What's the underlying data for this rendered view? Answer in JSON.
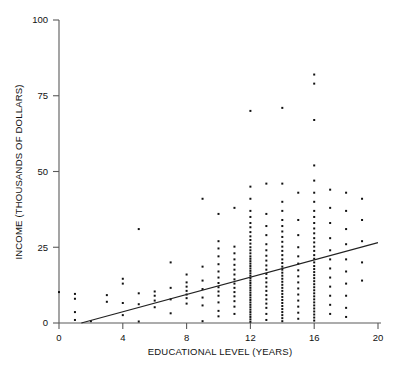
{
  "figure": {
    "title": "",
    "axis_color": "#5a5a5a",
    "point_color": "#111111",
    "line_color": "#222222",
    "background": "#ffffff"
  },
  "chart_data": {
    "type": "scatter",
    "title": "",
    "subtitle": "",
    "xlabel": "EDUCATIONAL LEVEL (YEARS)",
    "ylabel": "INCOME (THOUSANDS OF DOLLARS)",
    "xlim": [
      0,
      20
    ],
    "ylim": [
      0,
      100
    ],
    "xticks": [
      0,
      4,
      8,
      12,
      16,
      20
    ],
    "xtick_labels": [
      "0",
      "4",
      "8",
      "12",
      "16",
      "20"
    ],
    "yticks": [
      0,
      25,
      50,
      75,
      100
    ],
    "ytick_labels": [
      "0",
      "25",
      "50",
      "75",
      "100"
    ],
    "grid": false,
    "legend": null,
    "marker": "square",
    "marker_size_px": 2,
    "annotations": [],
    "series": [
      {
        "name": "Observations",
        "type": "scatter",
        "points": [
          [
            0,
            10.2
          ],
          [
            1,
            1.0
          ],
          [
            1,
            3.6
          ],
          [
            1,
            8.0
          ],
          [
            1,
            9.6
          ],
          [
            2,
            0.6
          ],
          [
            3,
            7.0
          ],
          [
            3,
            9.2
          ],
          [
            4,
            2.6
          ],
          [
            4,
            6.6
          ],
          [
            4,
            13.0
          ],
          [
            4,
            14.6
          ],
          [
            5,
            0.5
          ],
          [
            5,
            6.2
          ],
          [
            5,
            9.8
          ],
          [
            5,
            31.0
          ],
          [
            6,
            5.2
          ],
          [
            6,
            7.4
          ],
          [
            6,
            9.0
          ],
          [
            6,
            10.4
          ],
          [
            7,
            3.2
          ],
          [
            7,
            7.8
          ],
          [
            7,
            11.6
          ],
          [
            7,
            20.0
          ],
          [
            8,
            6.4
          ],
          [
            8,
            8.2
          ],
          [
            8,
            9.4
          ],
          [
            8,
            10.6
          ],
          [
            8,
            12.0
          ],
          [
            8,
            13.4
          ],
          [
            8,
            16.0
          ],
          [
            9,
            0.6
          ],
          [
            9,
            5.8
          ],
          [
            9,
            8.4
          ],
          [
            9,
            11.2
          ],
          [
            9,
            14.0
          ],
          [
            9,
            18.6
          ],
          [
            9,
            41.0
          ],
          [
            10,
            2.2
          ],
          [
            10,
            4.0
          ],
          [
            10,
            6.8
          ],
          [
            10,
            9.0
          ],
          [
            10,
            10.4
          ],
          [
            10,
            11.8
          ],
          [
            10,
            13.2
          ],
          [
            10,
            15.0
          ],
          [
            10,
            17.0
          ],
          [
            10,
            19.4
          ],
          [
            10,
            22.0
          ],
          [
            10,
            24.6
          ],
          [
            10,
            27.0
          ],
          [
            10,
            36.0
          ],
          [
            11,
            3.0
          ],
          [
            11,
            5.4
          ],
          [
            11,
            7.2
          ],
          [
            11,
            8.8
          ],
          [
            11,
            10.2
          ],
          [
            11,
            11.6
          ],
          [
            11,
            13.0
          ],
          [
            11,
            14.4
          ],
          [
            11,
            16.0
          ],
          [
            11,
            17.6
          ],
          [
            11,
            19.2
          ],
          [
            11,
            21.0
          ],
          [
            11,
            23.0
          ],
          [
            11,
            25.2
          ],
          [
            11,
            38.0
          ],
          [
            12,
            0.4
          ],
          [
            12,
            1.2
          ],
          [
            12,
            2.0
          ],
          [
            12,
            2.8
          ],
          [
            12,
            3.6
          ],
          [
            12,
            4.4
          ],
          [
            12,
            5.2
          ],
          [
            12,
            6.0
          ],
          [
            12,
            6.8
          ],
          [
            12,
            7.6
          ],
          [
            12,
            8.4
          ],
          [
            12,
            9.2
          ],
          [
            12,
            10.0
          ],
          [
            12,
            10.8
          ],
          [
            12,
            11.6
          ],
          [
            12,
            12.4
          ],
          [
            12,
            13.2
          ],
          [
            12,
            14.0
          ],
          [
            12,
            14.8
          ],
          [
            12,
            15.6
          ],
          [
            12,
            16.4
          ],
          [
            12,
            17.2
          ],
          [
            12,
            18.0
          ],
          [
            12,
            18.8
          ],
          [
            12,
            19.6
          ],
          [
            12,
            20.4
          ],
          [
            12,
            21.2
          ],
          [
            12,
            22.0
          ],
          [
            12,
            23.0
          ],
          [
            12,
            24.0
          ],
          [
            12,
            25.0
          ],
          [
            12,
            26.2
          ],
          [
            12,
            27.4
          ],
          [
            12,
            28.6
          ],
          [
            12,
            30.0
          ],
          [
            12,
            31.6
          ],
          [
            12,
            33.0
          ],
          [
            12,
            35.0
          ],
          [
            12,
            37.0
          ],
          [
            12,
            41.0
          ],
          [
            12,
            45.0
          ],
          [
            12,
            70.0
          ],
          [
            13,
            1.0
          ],
          [
            13,
            3.0
          ],
          [
            13,
            5.0
          ],
          [
            13,
            6.4
          ],
          [
            13,
            7.8
          ],
          [
            13,
            9.2
          ],
          [
            13,
            10.6
          ],
          [
            13,
            12.0
          ],
          [
            13,
            13.4
          ],
          [
            13,
            14.8
          ],
          [
            13,
            16.2
          ],
          [
            13,
            17.6
          ],
          [
            13,
            19.0
          ],
          [
            13,
            20.6
          ],
          [
            13,
            22.2
          ],
          [
            13,
            24.0
          ],
          [
            13,
            26.0
          ],
          [
            13,
            29.0
          ],
          [
            13,
            32.0
          ],
          [
            13,
            36.0
          ],
          [
            13,
            46.0
          ],
          [
            14,
            0.6
          ],
          [
            14,
            1.6
          ],
          [
            14,
            2.6
          ],
          [
            14,
            3.6
          ],
          [
            14,
            4.6
          ],
          [
            14,
            5.6
          ],
          [
            14,
            6.6
          ],
          [
            14,
            7.6
          ],
          [
            14,
            8.6
          ],
          [
            14,
            9.6
          ],
          [
            14,
            10.6
          ],
          [
            14,
            11.6
          ],
          [
            14,
            12.6
          ],
          [
            14,
            13.6
          ],
          [
            14,
            14.6
          ],
          [
            14,
            15.6
          ],
          [
            14,
            16.6
          ],
          [
            14,
            17.6
          ],
          [
            14,
            18.6
          ],
          [
            14,
            19.8
          ],
          [
            14,
            21.0
          ],
          [
            14,
            22.4
          ],
          [
            14,
            23.8
          ],
          [
            14,
            25.2
          ],
          [
            14,
            26.8
          ],
          [
            14,
            28.4
          ],
          [
            14,
            30.2
          ],
          [
            14,
            32.0
          ],
          [
            14,
            34.0
          ],
          [
            14,
            37.0
          ],
          [
            14,
            40.0
          ],
          [
            14,
            46.0
          ],
          [
            14,
            71.0
          ],
          [
            15,
            1.4
          ],
          [
            15,
            3.4
          ],
          [
            15,
            5.4
          ],
          [
            15,
            7.4
          ],
          [
            15,
            9.4
          ],
          [
            15,
            11.4
          ],
          [
            15,
            13.4
          ],
          [
            15,
            15.4
          ],
          [
            15,
            17.4
          ],
          [
            15,
            19.6
          ],
          [
            15,
            22.0
          ],
          [
            15,
            25.0
          ],
          [
            15,
            29.0
          ],
          [
            15,
            34.0
          ],
          [
            15,
            43.0
          ],
          [
            16,
            0.8
          ],
          [
            16,
            1.8
          ],
          [
            16,
            2.8
          ],
          [
            16,
            3.8
          ],
          [
            16,
            4.8
          ],
          [
            16,
            5.8
          ],
          [
            16,
            6.8
          ],
          [
            16,
            7.8
          ],
          [
            16,
            8.8
          ],
          [
            16,
            9.8
          ],
          [
            16,
            10.8
          ],
          [
            16,
            11.8
          ],
          [
            16,
            12.8
          ],
          [
            16,
            13.8
          ],
          [
            16,
            14.8
          ],
          [
            16,
            15.8
          ],
          [
            16,
            16.8
          ],
          [
            16,
            17.8
          ],
          [
            16,
            18.8
          ],
          [
            16,
            20.0
          ],
          [
            16,
            21.2
          ],
          [
            16,
            22.4
          ],
          [
            16,
            23.8
          ],
          [
            16,
            25.2
          ],
          [
            16,
            26.6
          ],
          [
            16,
            28.0
          ],
          [
            16,
            29.6
          ],
          [
            16,
            31.2
          ],
          [
            16,
            33.0
          ],
          [
            16,
            35.0
          ],
          [
            16,
            37.0
          ],
          [
            16,
            40.0
          ],
          [
            16,
            43.0
          ],
          [
            16,
            47.0
          ],
          [
            16,
            52.0
          ],
          [
            16,
            67.0
          ],
          [
            16,
            79.0
          ],
          [
            16,
            82.0
          ],
          [
            17,
            3.0
          ],
          [
            17,
            6.0
          ],
          [
            17,
            9.0
          ],
          [
            17,
            12.0
          ],
          [
            17,
            15.0
          ],
          [
            17,
            18.0
          ],
          [
            17,
            21.0
          ],
          [
            17,
            24.0
          ],
          [
            17,
            28.0
          ],
          [
            17,
            33.0
          ],
          [
            17,
            38.0
          ],
          [
            17,
            44.0
          ],
          [
            18,
            2.0
          ],
          [
            18,
            5.0
          ],
          [
            18,
            9.0
          ],
          [
            18,
            13.0
          ],
          [
            18,
            17.0
          ],
          [
            18,
            21.0
          ],
          [
            18,
            26.0
          ],
          [
            18,
            31.0
          ],
          [
            18,
            37.0
          ],
          [
            18,
            43.0
          ],
          [
            19,
            14.0
          ],
          [
            19,
            20.0
          ],
          [
            19,
            27.0
          ],
          [
            19,
            34.0
          ],
          [
            19,
            41.0
          ]
        ]
      },
      {
        "name": "Regression line",
        "type": "line",
        "x_start": 1.4,
        "y_start": 0,
        "x_end": 20,
        "y_end": 26.5
      }
    ]
  }
}
